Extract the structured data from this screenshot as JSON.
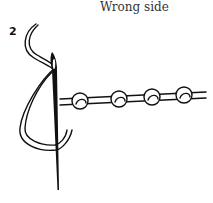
{
  "diagram": {
    "title": "Wrong side",
    "step_number": "2",
    "knot_count": 4,
    "colors": {
      "line": "#111111",
      "background": "#ffffff"
    }
  }
}
